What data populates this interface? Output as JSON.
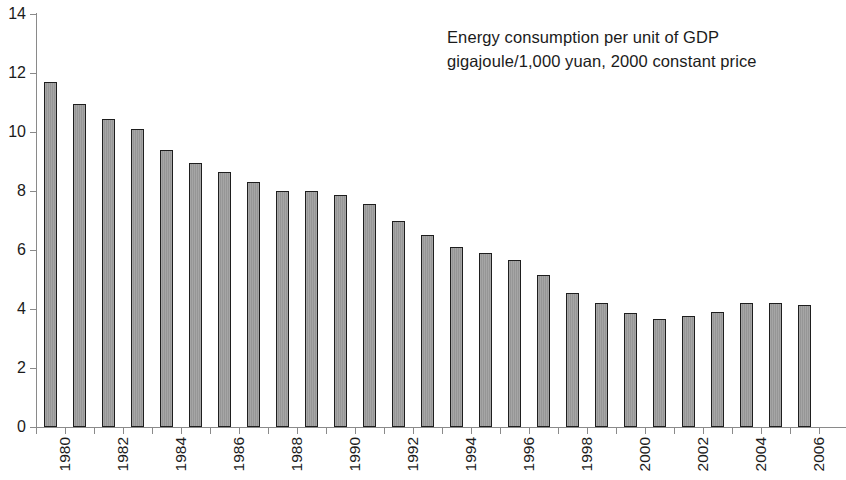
{
  "chart_data": {
    "type": "bar",
    "title": "Energy consumption per unit of GDP",
    "subtitle": "gigajoule/1,000 yuan, 2000 constant price",
    "xlabel": "",
    "ylabel": "",
    "ylim": [
      0,
      14
    ],
    "ytick_step": 2,
    "grid": false,
    "legend": "none",
    "bar_fill_color": "#9c9c9c",
    "bar_border_color": "#1e1e1e",
    "axis_color": "#8a8a8a",
    "categories": [
      "1980",
      "1981",
      "1982",
      "1983",
      "1984",
      "1985",
      "1986",
      "1987",
      "1988",
      "1989",
      "1990",
      "1991",
      "1992",
      "1993",
      "1994",
      "1995",
      "1996",
      "1997",
      "1998",
      "1999",
      "2000",
      "2001",
      "2002",
      "2003",
      "2004",
      "2005",
      "2006"
    ],
    "tick_labels": [
      "1980",
      "",
      "1982",
      "",
      "1984",
      "",
      "1986",
      "",
      "1988",
      "",
      "1990",
      "",
      "1992",
      "",
      "1994",
      "",
      "1996",
      "",
      "1998",
      "",
      "2000",
      "",
      "2002",
      "",
      "2004",
      "",
      "2006"
    ],
    "values": [
      11.7,
      10.95,
      10.45,
      10.1,
      9.4,
      8.95,
      8.65,
      8.3,
      8.0,
      8.0,
      7.85,
      7.55,
      7.0,
      6.5,
      6.1,
      5.9,
      5.65,
      5.15,
      4.55,
      4.2,
      3.85,
      3.65,
      3.75,
      3.9,
      4.2,
      4.2,
      4.15
    ],
    "ytick_labels": [
      "0",
      "2",
      "4",
      "6",
      "8",
      "10",
      "12",
      "14"
    ],
    "ytick_values": [
      0,
      2,
      4,
      6,
      8,
      10,
      12,
      14
    ]
  }
}
